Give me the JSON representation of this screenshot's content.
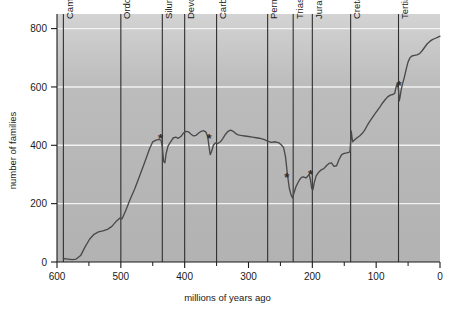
{
  "chart_data": {
    "type": "line",
    "title": "",
    "xlabel": "millions of years ago",
    "ylabel": "number of families",
    "xlim": [
      600,
      0
    ],
    "ylim": [
      0,
      850
    ],
    "x_reversed": true,
    "grid": "horizontal-white-gridlines",
    "legend": "none",
    "plot_background": "#b9b9b9",
    "line_color": "#4a4a4a",
    "xticks": [
      600,
      500,
      400,
      300,
      200,
      100,
      0
    ],
    "xtick_labels": [
      "600",
      "500",
      "400",
      "300",
      "200",
      "100",
      "0"
    ],
    "xminor_ticks": [
      550,
      450,
      350,
      250,
      150,
      50
    ],
    "yticks": [
      0,
      200,
      400,
      600,
      800
    ],
    "ytick_labels": [
      "0",
      "200",
      "400",
      "600",
      "800"
    ],
    "period_boundaries": [
      {
        "label": "Cambrian",
        "start": 590,
        "end": 500,
        "line_at": 590
      },
      {
        "label": "Ordovician",
        "start": 500,
        "end": 435,
        "line_at": 500
      },
      {
        "label": "Silurian",
        "start": 435,
        "end": 400,
        "line_at": 435
      },
      {
        "label": "Devonian",
        "start": 400,
        "end": 350,
        "line_at": 400
      },
      {
        "label": "Carboniferous",
        "start": 350,
        "end": 270,
        "line_at": 350
      },
      {
        "label": "Permian",
        "start": 270,
        "end": 230,
        "line_at": 270
      },
      {
        "label": "Triassic",
        "start": 230,
        "end": 200,
        "line_at": 230
      },
      {
        "label": "Jurassic",
        "start": 200,
        "end": 140,
        "line_at": 200
      },
      {
        "label": "Cretaceous",
        "start": 140,
        "end": 65,
        "line_at": 140
      },
      {
        "label": "Tertiary",
        "start": 65,
        "end": 0,
        "line_at": 65
      }
    ],
    "extinction_markers": [
      {
        "symbol": "*",
        "x": 438,
        "y": 425,
        "name": "end-Ordovician"
      },
      {
        "symbol": "*",
        "x": 362,
        "y": 425,
        "name": "Late Devonian"
      },
      {
        "symbol": "*",
        "x": 240,
        "y": 290,
        "name": "end-Permian"
      },
      {
        "symbol": "*",
        "x": 203,
        "y": 300,
        "name": "end-Triassic"
      },
      {
        "symbol": "*",
        "x": 64,
        "y": 605,
        "name": "end-Cretaceous"
      }
    ],
    "series": [
      {
        "name": "marine family diversity",
        "points": [
          [
            590,
            12
          ],
          [
            583,
            10
          ],
          [
            576,
            8
          ],
          [
            570,
            10
          ],
          [
            563,
            22
          ],
          [
            556,
            52
          ],
          [
            549,
            78
          ],
          [
            542,
            95
          ],
          [
            535,
            103
          ],
          [
            528,
            107
          ],
          [
            521,
            112
          ],
          [
            514,
            122
          ],
          [
            507,
            140
          ],
          [
            502,
            150
          ],
          [
            498,
            148
          ],
          [
            492,
            178
          ],
          [
            486,
            212
          ],
          [
            478,
            252
          ],
          [
            470,
            298
          ],
          [
            462,
            345
          ],
          [
            455,
            388
          ],
          [
            450,
            412
          ],
          [
            445,
            418
          ],
          [
            440,
            420
          ],
          [
            437,
            418
          ],
          [
            435,
            395
          ],
          [
            433,
            345
          ],
          [
            431,
            340
          ],
          [
            429,
            372
          ],
          [
            426,
            398
          ],
          [
            422,
            412
          ],
          [
            418,
            425
          ],
          [
            414,
            428
          ],
          [
            410,
            424
          ],
          [
            406,
            430
          ],
          [
            402,
            442
          ],
          [
            398,
            448
          ],
          [
            394,
            446
          ],
          [
            390,
            438
          ],
          [
            386,
            432
          ],
          [
            382,
            434
          ],
          [
            378,
            442
          ],
          [
            374,
            448
          ],
          [
            370,
            450
          ],
          [
            367,
            446
          ],
          [
            364,
            432
          ],
          [
            362,
            398
          ],
          [
            360,
            368
          ],
          [
            358,
            378
          ],
          [
            355,
            400
          ],
          [
            352,
            408
          ],
          [
            348,
            406
          ],
          [
            344,
            412
          ],
          [
            340,
            424
          ],
          [
            336,
            438
          ],
          [
            332,
            448
          ],
          [
            328,
            452
          ],
          [
            324,
            448
          ],
          [
            320,
            440
          ],
          [
            316,
            436
          ],
          [
            312,
            434
          ],
          [
            306,
            432
          ],
          [
            300,
            430
          ],
          [
            294,
            428
          ],
          [
            288,
            426
          ],
          [
            282,
            424
          ],
          [
            276,
            420
          ],
          [
            270,
            414
          ],
          [
            264,
            410
          ],
          [
            258,
            412
          ],
          [
            252,
            408
          ],
          [
            248,
            400
          ],
          [
            245,
            392
          ],
          [
            242,
            360
          ],
          [
            239,
            300
          ],
          [
            236,
            252
          ],
          [
            233,
            228
          ],
          [
            231,
            220
          ],
          [
            229,
            235
          ],
          [
            226,
            256
          ],
          [
            223,
            270
          ],
          [
            220,
            282
          ],
          [
            217,
            290
          ],
          [
            214,
            292
          ],
          [
            210,
            288
          ],
          [
            207,
            295
          ],
          [
            205,
            300
          ],
          [
            203,
            282
          ],
          [
            201,
            252
          ],
          [
            199,
            248
          ],
          [
            197,
            272
          ],
          [
            194,
            295
          ],
          [
            190,
            308
          ],
          [
            186,
            316
          ],
          [
            182,
            320
          ],
          [
            178,
            330
          ],
          [
            174,
            338
          ],
          [
            170,
            340
          ],
          [
            166,
            328
          ],
          [
            162,
            330
          ],
          [
            158,
            352
          ],
          [
            154,
            368
          ],
          [
            150,
            372
          ],
          [
            146,
            374
          ],
          [
            143,
            376
          ],
          [
            141,
            378
          ],
          [
            139,
            448
          ],
          [
            137,
            412
          ],
          [
            134,
            418
          ],
          [
            130,
            426
          ],
          [
            126,
            432
          ],
          [
            122,
            440
          ],
          [
            118,
            452
          ],
          [
            114,
            468
          ],
          [
            110,
            482
          ],
          [
            106,
            495
          ],
          [
            102,
            508
          ],
          [
            98,
            520
          ],
          [
            94,
            532
          ],
          [
            90,
            545
          ],
          [
            86,
            556
          ],
          [
            82,
            566
          ],
          [
            78,
            572
          ],
          [
            74,
            574
          ],
          [
            71,
            578
          ],
          [
            69,
            598
          ],
          [
            67,
            612
          ],
          [
            65,
            590
          ],
          [
            64,
            552
          ],
          [
            63,
            560
          ],
          [
            61,
            588
          ],
          [
            59,
            608
          ],
          [
            56,
            632
          ],
          [
            53,
            660
          ],
          [
            50,
            686
          ],
          [
            47,
            700
          ],
          [
            44,
            706
          ],
          [
            40,
            708
          ],
          [
            36,
            710
          ],
          [
            32,
            714
          ],
          [
            28,
            724
          ],
          [
            24,
            736
          ],
          [
            20,
            748
          ],
          [
            16,
            756
          ],
          [
            12,
            762
          ],
          [
            8,
            766
          ],
          [
            4,
            770
          ],
          [
            0,
            774
          ]
        ]
      }
    ]
  }
}
